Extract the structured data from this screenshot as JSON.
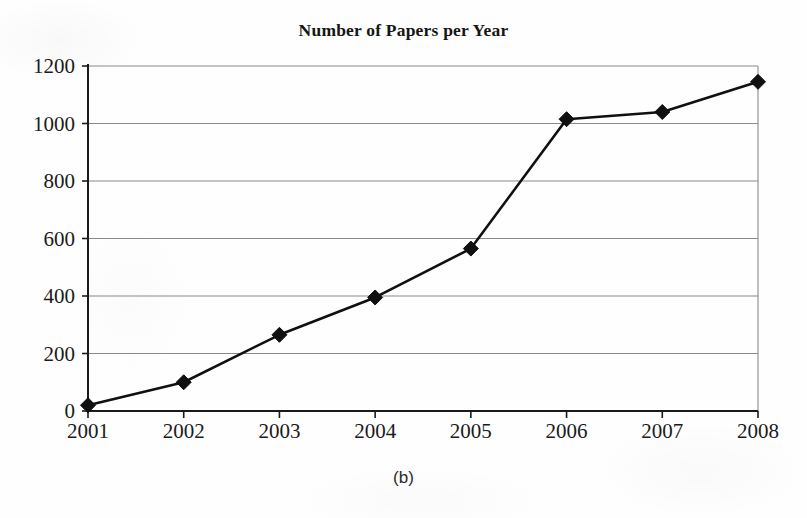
{
  "figure": {
    "title": "Number of Papers per Year",
    "caption": "(b)"
  },
  "axes": {
    "y_ticks": [
      "0",
      "200",
      "400",
      "600",
      "800",
      "1000",
      "1200"
    ],
    "x_ticks": [
      "2001",
      "2002",
      "2003",
      "2004",
      "2005",
      "2006",
      "2007",
      "2008"
    ]
  },
  "style": {
    "line_color": "#101010",
    "marker_color": "#101010",
    "grid_color": "#8a8a8a",
    "axis_color": "#1a1a1a",
    "background": "#fefefe"
  },
  "chart_data": {
    "type": "line",
    "title": "Number of Papers per Year",
    "xlabel": "",
    "ylabel": "",
    "categories": [
      "2001",
      "2002",
      "2003",
      "2004",
      "2005",
      "2006",
      "2007",
      "2008"
    ],
    "x": [
      2001,
      2002,
      2003,
      2004,
      2005,
      2006,
      2007,
      2008
    ],
    "values": [
      20,
      100,
      265,
      395,
      565,
      1015,
      1040,
      1145
    ],
    "series": [
      {
        "name": "Number of Papers",
        "values": [
          20,
          100,
          265,
          395,
          565,
          1015,
          1040,
          1145
        ]
      }
    ],
    "ylim": [
      0,
      1200
    ],
    "yticks": [
      0,
      200,
      400,
      600,
      800,
      1000,
      1200
    ],
    "xlim": [
      2001,
      2008
    ],
    "grid": "horizontal",
    "legend": "none",
    "marker": "diamond",
    "annotations": [
      "(b)"
    ]
  }
}
